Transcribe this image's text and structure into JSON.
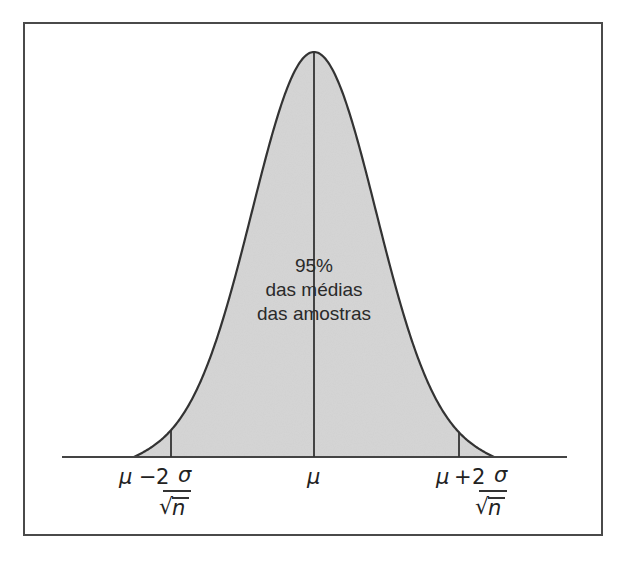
{
  "chart_data": {
    "type": "area",
    "title": "",
    "center_annotation": [
      "95%",
      "das médias",
      "das amostras"
    ],
    "x_ticks": [
      "μ − 2 σ/√n",
      "μ",
      "μ + 2 σ/√n"
    ],
    "reference_lines": [
      {
        "x": "μ − 2σ/√n",
        "label": "lower"
      },
      {
        "x": "μ",
        "label": "mean"
      },
      {
        "x": "μ + 2σ/√n",
        "label": "upper"
      }
    ],
    "shaded_percent": 95,
    "fill_color": "#d9d9d9",
    "line_color": "#333333",
    "grid": false,
    "legend": null
  },
  "labels": {
    "pct": "95%",
    "line1": "das médias",
    "line2": "das amostras",
    "mu": "μ",
    "minus": "−",
    "plus": "+",
    "two": "2",
    "sigma": "σ",
    "n": "n",
    "radical": "√"
  }
}
